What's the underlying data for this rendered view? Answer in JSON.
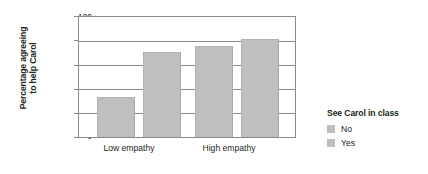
{
  "chart_data": {
    "type": "bar",
    "title": "",
    "xlabel": "",
    "ylabel_line1": "Percentage agreeing",
    "ylabel_line2": "to help Carol",
    "categories": [
      "Low empathy",
      "High empathy"
    ],
    "series": [
      {
        "name": "No",
        "values": [
          33,
          76
        ],
        "color": "#bfbfbf"
      },
      {
        "name": "Yes",
        "values": [
          71,
          82
        ],
        "color": "#bfbfbf"
      }
    ],
    "ylim": [
      0,
      100
    ],
    "yticks": [
      0,
      20,
      40,
      60,
      80,
      100
    ],
    "ytick_labels": [
      "0",
      "20",
      "40",
      "60",
      "80",
      "100"
    ],
    "grid": true,
    "grid_axis": "y",
    "legend": {
      "title": "See Carol in class",
      "position": "right",
      "entries": [
        {
          "label": "No",
          "color": "#bfbfbf"
        },
        {
          "label": "Yes",
          "color": "#bfbfbf"
        }
      ]
    },
    "bars": [
      {
        "group": "Low empathy",
        "series": "No",
        "value": 33
      },
      {
        "group": "Low empathy",
        "series": "Yes",
        "value": 71
      },
      {
        "group": "High empathy",
        "series": "No",
        "value": 76
      },
      {
        "group": "High empathy",
        "series": "Yes",
        "value": 82
      }
    ]
  }
}
